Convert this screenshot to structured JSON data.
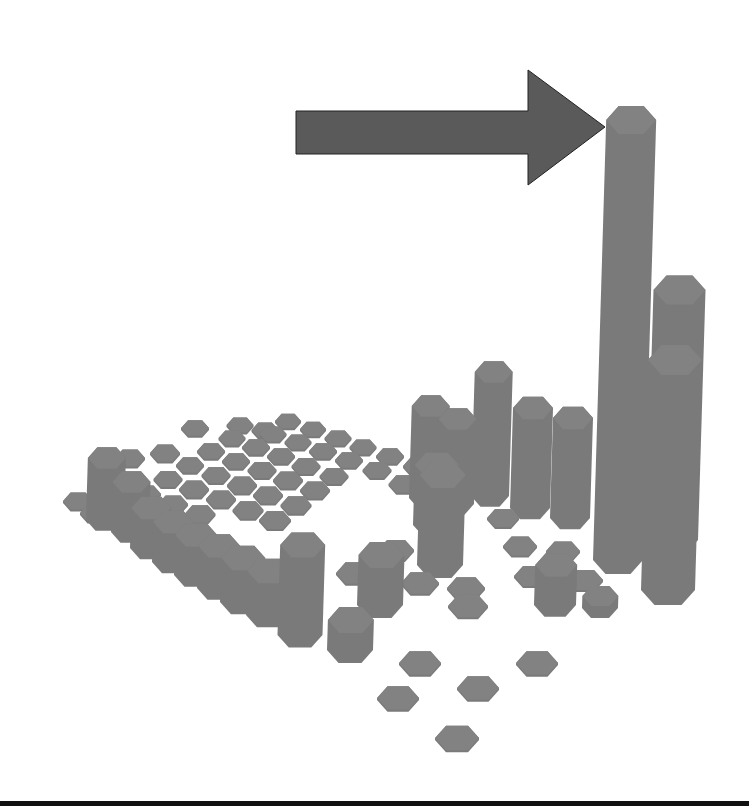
{
  "chart_data": {
    "type": "bar3d",
    "title": "",
    "xlabel": "",
    "ylabel": "",
    "zlabel": "",
    "grid": false,
    "legend": null,
    "bar_shape": "hexagonal prism",
    "grid_size": [
      10,
      10
    ],
    "heights": [
      [
        0,
        0,
        0,
        0,
        0,
        0,
        0,
        0,
        0,
        0
      ],
      [
        0,
        0,
        0,
        0,
        0,
        0,
        0,
        0,
        0,
        0
      ],
      [
        0,
        0,
        0,
        0,
        0,
        0,
        0,
        0,
        0,
        0
      ],
      [
        0,
        0,
        0,
        0,
        0,
        0,
        0,
        0,
        0,
        0
      ],
      [
        0,
        0,
        0,
        0,
        0,
        0,
        0,
        0,
        0,
        0
      ],
      [
        0,
        0,
        0,
        0,
        0,
        0,
        0,
        0,
        0,
        0
      ],
      [
        0,
        0,
        0,
        0,
        0,
        0,
        0,
        0,
        0,
        0
      ],
      [
        0,
        0,
        0,
        0,
        0,
        0,
        0,
        0,
        0,
        0
      ],
      [
        0,
        0,
        0,
        0,
        0,
        0,
        0,
        0,
        0,
        0
      ],
      [
        0,
        0,
        0,
        0,
        0,
        0,
        0,
        0,
        0,
        0
      ]
    ],
    "columns": [
      {
        "x": 288,
        "y": 423,
        "w": 26,
        "h": 2
      },
      {
        "x": 313,
        "y": 431,
        "w": 26,
        "h": 2
      },
      {
        "x": 338,
        "y": 440,
        "w": 27,
        "h": 2
      },
      {
        "x": 363,
        "y": 449,
        "w": 27,
        "h": 2
      },
      {
        "x": 390,
        "y": 458,
        "w": 28,
        "h": 2
      },
      {
        "x": 273,
        "y": 436,
        "w": 27,
        "h": 2
      },
      {
        "x": 298,
        "y": 444,
        "w": 27,
        "h": 2
      },
      {
        "x": 323,
        "y": 453,
        "w": 28,
        "h": 2
      },
      {
        "x": 349,
        "y": 462,
        "w": 28,
        "h": 2
      },
      {
        "x": 377,
        "y": 472,
        "w": 29,
        "h": 2
      },
      {
        "x": 232,
        "y": 440,
        "w": 27,
        "h": 2
      },
      {
        "x": 256,
        "y": 449,
        "w": 28,
        "h": 2
      },
      {
        "x": 281,
        "y": 458,
        "w": 28,
        "h": 2
      },
      {
        "x": 306,
        "y": 468,
        "w": 29,
        "h": 2
      },
      {
        "x": 334,
        "y": 478,
        "w": 29,
        "h": 2
      },
      {
        "x": 211,
        "y": 453,
        "w": 28,
        "h": 2
      },
      {
        "x": 236,
        "y": 463,
        "w": 28,
        "h": 2
      },
      {
        "x": 262,
        "y": 472,
        "w": 29,
        "h": 2
      },
      {
        "x": 288,
        "y": 482,
        "w": 30,
        "h": 2
      },
      {
        "x": 315,
        "y": 492,
        "w": 30,
        "h": 2
      },
      {
        "x": 190,
        "y": 467,
        "w": 28,
        "h": 2
      },
      {
        "x": 216,
        "y": 477,
        "w": 29,
        "h": 2
      },
      {
        "x": 242,
        "y": 487,
        "w": 30,
        "h": 2
      },
      {
        "x": 268,
        "y": 497,
        "w": 30,
        "h": 2
      },
      {
        "x": 296,
        "y": 507,
        "w": 31,
        "h": 2
      },
      {
        "x": 168,
        "y": 481,
        "w": 29,
        "h": 2
      },
      {
        "x": 194,
        "y": 491,
        "w": 30,
        "h": 2
      },
      {
        "x": 221,
        "y": 501,
        "w": 30,
        "h": 2
      },
      {
        "x": 248,
        "y": 512,
        "w": 31,
        "h": 2
      },
      {
        "x": 275,
        "y": 522,
        "w": 32,
        "h": 2
      },
      {
        "x": 146,
        "y": 496,
        "w": 30,
        "h": 2
      },
      {
        "x": 173,
        "y": 506,
        "w": 30,
        "h": 2
      },
      {
        "x": 200,
        "y": 516,
        "w": 31,
        "h": 2
      },
      {
        "x": 78,
        "y": 503,
        "w": 30,
        "h": 2
      },
      {
        "x": 95,
        "y": 515,
        "w": 30,
        "h": 2
      },
      {
        "x": 130,
        "y": 460,
        "w": 30,
        "h": 2
      },
      {
        "x": 165,
        "y": 455,
        "w": 30,
        "h": 2
      },
      {
        "x": 195,
        "y": 430,
        "w": 28,
        "h": 2
      },
      {
        "x": 240,
        "y": 427,
        "w": 27,
        "h": 2
      },
      {
        "x": 265,
        "y": 432,
        "w": 27,
        "h": 2
      },
      {
        "x": 418,
        "y": 468,
        "w": 30,
        "h": 2
      },
      {
        "x": 442,
        "y": 478,
        "w": 30,
        "h": 2
      },
      {
        "x": 404,
        "y": 486,
        "w": 31,
        "h": 2
      },
      {
        "x": 105,
        "y": 520,
        "w": 38,
        "h": 62
      },
      {
        "x": 130,
        "y": 532,
        "w": 38,
        "h": 50
      },
      {
        "x": 150,
        "y": 548,
        "w": 40,
        "h": 40
      },
      {
        "x": 172,
        "y": 562,
        "w": 40,
        "h": 40
      },
      {
        "x": 195,
        "y": 575,
        "w": 42,
        "h": 40
      },
      {
        "x": 218,
        "y": 588,
        "w": 42,
        "h": 42
      },
      {
        "x": 242,
        "y": 602,
        "w": 44,
        "h": 44
      },
      {
        "x": 268,
        "y": 615,
        "w": 44,
        "h": 44
      },
      {
        "x": 300,
        "y": 635,
        "w": 45,
        "h": 90
      },
      {
        "x": 428,
        "y": 498,
        "w": 38,
        "h": 92
      },
      {
        "x": 455,
        "y": 504,
        "w": 38,
        "h": 85
      },
      {
        "x": 490,
        "y": 496,
        "w": 38,
        "h": 124
      },
      {
        "x": 530,
        "y": 508,
        "w": 40,
        "h": 100
      },
      {
        "x": 570,
        "y": 518,
        "w": 40,
        "h": 100
      },
      {
        "x": 503,
        "y": 520,
        "w": 32,
        "h": 2
      },
      {
        "x": 520,
        "y": 548,
        "w": 34,
        "h": 2
      },
      {
        "x": 563,
        "y": 553,
        "w": 34,
        "h": 2
      },
      {
        "x": 532,
        "y": 578,
        "w": 36,
        "h": 2
      },
      {
        "x": 585,
        "y": 582,
        "w": 36,
        "h": 2
      },
      {
        "x": 600,
        "y": 608,
        "w": 36,
        "h": 12
      },
      {
        "x": 396,
        "y": 552,
        "w": 36,
        "h": 2
      },
      {
        "x": 355,
        "y": 575,
        "w": 38,
        "h": 2
      },
      {
        "x": 420,
        "y": 585,
        "w": 38,
        "h": 2
      },
      {
        "x": 466,
        "y": 590,
        "w": 38,
        "h": 2
      },
      {
        "x": 555,
        "y": 605,
        "w": 42,
        "h": 40
      },
      {
        "x": 435,
        "y": 525,
        "w": 44,
        "h": 60
      },
      {
        "x": 440,
        "y": 565,
        "w": 46,
        "h": 90
      },
      {
        "x": 380,
        "y": 605,
        "w": 46,
        "h": 50
      },
      {
        "x": 350,
        "y": 650,
        "w": 46,
        "h": 30
      },
      {
        "x": 468,
        "y": 608,
        "w": 40,
        "h": 2
      },
      {
        "x": 420,
        "y": 665,
        "w": 42,
        "h": 2
      },
      {
        "x": 478,
        "y": 690,
        "w": 42,
        "h": 2
      },
      {
        "x": 537,
        "y": 665,
        "w": 42,
        "h": 2
      },
      {
        "x": 398,
        "y": 700,
        "w": 42,
        "h": 2
      },
      {
        "x": 457,
        "y": 740,
        "w": 44,
        "h": 2
      },
      {
        "x": 618,
        "y": 560,
        "w": 50,
        "h": 440
      },
      {
        "x": 672,
        "y": 540,
        "w": 52,
        "h": 250
      },
      {
        "x": 668,
        "y": 590,
        "w": 54,
        "h": 230
      }
    ],
    "annotation": {
      "type": "block-arrow",
      "direction": "right",
      "points_to": "tallest column",
      "color": "#5a5a5a"
    },
    "bar_color": "#7a7a7a",
    "bar_top_color": "#828282",
    "background": "#ffffff",
    "rule_color": "#111111"
  }
}
